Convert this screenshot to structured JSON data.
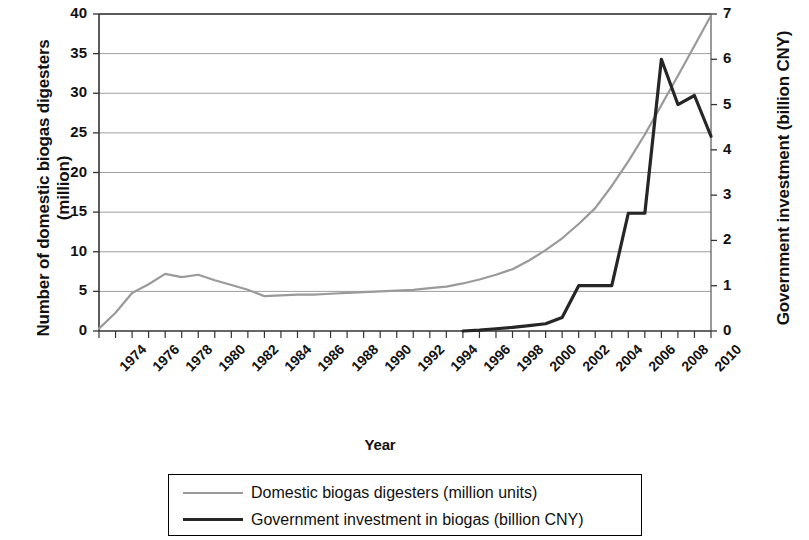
{
  "chart_data": {
    "type": "line",
    "title": "",
    "xlabel": "Year",
    "ylabel": "Number of domestic biogas digesters (million)",
    "ylabel2": "Government investment (billion CNY)",
    "xlim": [
      1974,
      2011
    ],
    "ylim": [
      0,
      40
    ],
    "ylim2": [
      0,
      7
    ],
    "grid": true,
    "legend_position": "bottom",
    "yticks": [
      0,
      5,
      10,
      15,
      20,
      25,
      30,
      35,
      40
    ],
    "yticks2": [
      0,
      1,
      2,
      3,
      4,
      5,
      6,
      7
    ],
    "xticks": [
      1974,
      1976,
      1978,
      1980,
      1982,
      1984,
      1986,
      1988,
      1990,
      1992,
      1994,
      1996,
      1998,
      2000,
      2002,
      2004,
      2006,
      2008,
      2010
    ],
    "x": [
      1974,
      1975,
      1976,
      1977,
      1978,
      1979,
      1980,
      1981,
      1982,
      1983,
      1984,
      1985,
      1986,
      1987,
      1988,
      1989,
      1990,
      1991,
      1992,
      1993,
      1994,
      1995,
      1996,
      1997,
      1998,
      1999,
      2000,
      2001,
      2002,
      2003,
      2004,
      2005,
      2006,
      2007,
      2008,
      2009,
      2010,
      2011
    ],
    "series": [
      {
        "name": "Domestic biogas digesters (million units)",
        "axis": "left",
        "color": "#9a9a9a",
        "values": [
          0.3,
          2.3,
          4.8,
          5.9,
          7.2,
          6.8,
          7.1,
          6.4,
          5.8,
          5.2,
          4.4,
          4.5,
          4.6,
          4.6,
          4.7,
          4.8,
          4.9,
          5.0,
          5.1,
          5.2,
          5.4,
          5.6,
          6.0,
          6.5,
          7.1,
          7.8,
          8.9,
          10.2,
          11.7,
          13.5,
          15.5,
          18.3,
          21.4,
          24.8,
          28.5,
          32.2,
          36.0,
          39.8
        ]
      },
      {
        "name": "Government investment in biogas (billion CNY)",
        "axis": "right",
        "color": "#262626",
        "values": [
          null,
          null,
          null,
          null,
          null,
          null,
          null,
          null,
          null,
          null,
          null,
          null,
          null,
          null,
          null,
          null,
          null,
          null,
          null,
          null,
          null,
          null,
          0.0,
          0.02,
          0.05,
          0.08,
          0.12,
          0.16,
          0.3,
          1.0,
          1.0,
          1.0,
          2.6,
          2.6,
          6.0,
          5.0,
          5.2,
          4.3
        ]
      }
    ]
  },
  "axes": {
    "left_title_line1": "Number of domestic biogas digesters",
    "left_title_line2": "(million)",
    "right_title": "Government investment (billion CNY)",
    "x_title": "Year"
  },
  "legend": {
    "items": [
      {
        "label": "Domestic biogas digesters (million units)",
        "style": "gray"
      },
      {
        "label": "Government investment in biogas (billion CNY)",
        "style": "black"
      }
    ]
  }
}
